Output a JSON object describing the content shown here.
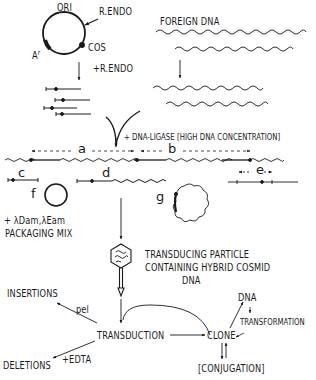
{
  "diagram": {
    "type": "cosmid-cloning-flowchart",
    "vector": {
      "labels": {
        "ori": "ORI",
        "rendo_site": "R.ENDO",
        "cos": "COS",
        "ampr": "A",
        "ampr_sup": "r"
      },
      "step_label": "+R.ENDO"
    },
    "foreign_dna": {
      "label": "FOREIGN DNA"
    },
    "ligation": {
      "label": "+ DNA-LIGASE [HIGH DNA CONCENTRATION]"
    },
    "products": {
      "a": "a",
      "b": "b",
      "c": "c",
      "d": "d",
      "e": "e",
      "f": "f",
      "g": "g"
    },
    "packaging": {
      "line1": "+ λDam,λEam",
      "line2": "PACKAGING MIX"
    },
    "particle": {
      "line1": "TRANSDUCING PARTICLE",
      "line2": "CONTAINING HYBRID COSMID",
      "line3": "DNA"
    },
    "outcomes": {
      "insertions": "INSERTIONS",
      "pel": "pel",
      "transduction": "TRANSDUCTION",
      "deletions": "DELETIONS",
      "edta": "+EDTA",
      "clone": "CLONE",
      "dna": "DNA",
      "transformation": "TRANSFORMATION",
      "conjugation": "[CONJUGATION]"
    },
    "colors": {
      "ink": "#1a1a1a",
      "background": "#ffffff"
    }
  }
}
